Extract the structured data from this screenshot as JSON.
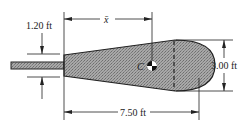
{
  "diagram": {
    "type": "engineering-dimension-drawing",
    "dimensions": {
      "rod_gap": "1.20 ft",
      "centroid_distance": "x̄",
      "total_length": "7.50 ft",
      "end_width": "3.00 ft"
    },
    "labels": {
      "centroid": "C"
    },
    "colors": {
      "fill": "#9a9a9a",
      "line": "#222222",
      "background": "#ffffff"
    }
  }
}
